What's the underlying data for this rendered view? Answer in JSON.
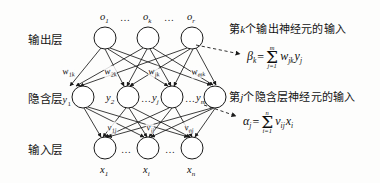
{
  "diagram": {
    "background_color": "#fdfdfc",
    "stroke_color": "#1a1a1a",
    "layer_labels": {
      "output": "输出层",
      "hidden_prefix": "隐含层",
      "hidden_first_node": "y",
      "hidden_first_node_sub": "1",
      "input": "输入层"
    },
    "output_nodes": [
      {
        "label": "o",
        "sub": "1"
      },
      {
        "label": "o",
        "sub": "k"
      },
      {
        "label": "o",
        "sub": "r"
      }
    ],
    "output_ellipses": [
      "…",
      "…"
    ],
    "hidden_nodes": [
      {
        "label": "y",
        "sub": "2"
      },
      {
        "label": "y",
        "sub": "j"
      },
      {
        "label": "y",
        "sub": "m"
      }
    ],
    "hidden_ellipses": [
      "…",
      "…"
    ],
    "input_nodes": [
      {
        "label": "x",
        "sub": "1"
      },
      {
        "label": "x",
        "sub": "i"
      },
      {
        "label": "x",
        "sub": "n"
      }
    ],
    "input_ellipses": [
      "…",
      "…"
    ],
    "weights_hidden_to_output": [
      {
        "label": "w",
        "sub": "1k"
      },
      {
        "label": "w",
        "sub": "2k"
      },
      {
        "label": "w",
        "sub": "jk"
      },
      {
        "label": "w",
        "sub": "mk"
      }
    ],
    "weights_input_to_hidden": [
      {
        "label": "v",
        "sub": "1j"
      },
      {
        "label": "v",
        "sub": "ij"
      },
      {
        "label": "v",
        "sub": "nj"
      }
    ],
    "annotations": [
      {
        "text_before": "第",
        "italic": "k",
        "text_after": "个输出神经元的输入"
      },
      {
        "text_before": "第",
        "italic": "j",
        "text_after": "个隐含层神经元的输入"
      }
    ],
    "formulas": [
      {
        "lhs": "β",
        "lhs_sub": "k",
        "eq": "=",
        "sum_upper": "m",
        "sum_lower": "j=1",
        "term1": "w",
        "term1_sub": "jk",
        "term2": "y",
        "term2_sub": "j"
      },
      {
        "lhs": "α",
        "lhs_sub": "j",
        "eq": "=",
        "sum_upper": "n",
        "sum_lower": "i=1",
        "term1": "v",
        "term1_sub": "ij",
        "term2": "x",
        "term2_sub": "i"
      }
    ]
  }
}
